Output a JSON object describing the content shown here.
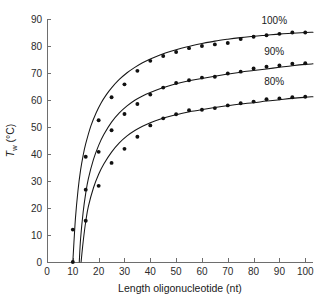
{
  "chart_data": {
    "type": "scatter",
    "title": "",
    "subtitle": "",
    "xlabel": "Length oligonucleotide (nt)",
    "ylabel": "T_w (°C)",
    "ylabel_parts": {
      "symbol": "T",
      "subscript": "w",
      "unit": "(°C)"
    },
    "xlim": [
      0,
      103
    ],
    "ylim": [
      0,
      90
    ],
    "xticks": [
      0,
      10,
      20,
      30,
      40,
      50,
      60,
      70,
      80,
      90,
      100
    ],
    "yticks": [
      0,
      10,
      20,
      30,
      40,
      50,
      60,
      70,
      80,
      90
    ],
    "xtick_labels": [
      "0",
      "10",
      "20",
      "30",
      "40",
      "50",
      "60",
      "70",
      "80",
      "90",
      "100"
    ],
    "ytick_labels": [
      "0",
      "10",
      "20",
      "30",
      "40",
      "50",
      "60",
      "70",
      "80",
      "90"
    ],
    "grid": false,
    "legend_position": "inline-right-of-curves",
    "marker": "filled-circle",
    "marker_color": "#111111",
    "line_color": "#161616",
    "axis_color": "#6e6e6e",
    "series": [
      {
        "name": "100%",
        "label": "100%",
        "label_x": 88,
        "label_y": 88,
        "x": [
          10,
          15,
          20,
          25,
          30,
          35,
          40,
          45,
          50,
          55,
          60,
          65,
          70,
          75,
          80,
          85,
          90,
          95,
          100
        ],
        "values": [
          12.0,
          39.0,
          52.5,
          61.0,
          65.8,
          70.8,
          74.5,
          76.3,
          77.8,
          79.2,
          80.0,
          80.6,
          81.1,
          82.6,
          83.4,
          84.0,
          84.5,
          85.0,
          85.0
        ],
        "curve_x": [
          10.0,
          11,
          12,
          13,
          14,
          15,
          17,
          19,
          21,
          23,
          25,
          28,
          31,
          34,
          37,
          40,
          44,
          48,
          52,
          56,
          60,
          65,
          70,
          75,
          80,
          85,
          90,
          95,
          100,
          103
        ],
        "curve_y": [
          0.0,
          16.0,
          26.5,
          34.0,
          39.5,
          43.8,
          50.4,
          55.2,
          59.0,
          62.0,
          64.5,
          67.6,
          70.1,
          72.1,
          73.8,
          75.2,
          76.8,
          78.1,
          79.2,
          80.1,
          80.9,
          81.8,
          82.5,
          83.1,
          83.6,
          84.0,
          84.4,
          84.7,
          85.0,
          85.1
        ]
      },
      {
        "name": "90%",
        "label": "90%",
        "label_x": 88,
        "label_y": 76.5,
        "x": [
          10,
          15,
          20,
          25,
          30,
          35,
          40,
          45,
          50,
          55,
          60,
          65,
          70,
          75,
          80,
          85,
          90,
          95,
          100
        ],
        "values": [
          0.0,
          26.8,
          40.8,
          48.8,
          54.8,
          58.5,
          62.0,
          64.6,
          66.3,
          67.3,
          68.3,
          68.6,
          69.8,
          70.5,
          71.7,
          72.3,
          72.8,
          73.4,
          73.6
        ],
        "curve_x": [
          12.5,
          13,
          14,
          15,
          16,
          18,
          20,
          22,
          25,
          28,
          31,
          34,
          37,
          40,
          44,
          48,
          52,
          56,
          60,
          65,
          70,
          75,
          80,
          85,
          90,
          95,
          100,
          103
        ],
        "curve_y": [
          0.0,
          8.5,
          18.5,
          25.5,
          30.8,
          38.0,
          43.2,
          47.2,
          51.8,
          55.2,
          57.8,
          59.9,
          61.5,
          62.8,
          64.3,
          65.5,
          66.5,
          67.3,
          68.0,
          68.8,
          69.6,
          70.3,
          70.9,
          71.5,
          72.1,
          72.7,
          73.2,
          73.4
        ]
      },
      {
        "name": "80%",
        "label": "80%",
        "label_x": 88,
        "label_y": 65.5,
        "x": [
          15,
          20,
          25,
          30,
          35,
          40,
          45,
          50,
          55,
          60,
          65,
          70,
          75,
          80,
          85,
          90,
          95,
          100
        ],
        "values": [
          15.3,
          28.2,
          36.7,
          41.9,
          46.4,
          50.6,
          53.2,
          54.7,
          56.2,
          56.4,
          57.0,
          58.0,
          58.8,
          59.4,
          60.3,
          60.6,
          61.0,
          61.2
        ],
        "curve_x": [
          13.2,
          14,
          15,
          16,
          18,
          20,
          22,
          25,
          28,
          31,
          34,
          37,
          40,
          44,
          48,
          52,
          56,
          60,
          65,
          70,
          75,
          80,
          85,
          90,
          95,
          100,
          103
        ],
        "curve_y": [
          0.0,
          7.5,
          15.0,
          20.5,
          27.5,
          32.5,
          36.3,
          40.7,
          44.1,
          46.7,
          48.7,
          50.3,
          51.6,
          53.0,
          54.1,
          55.0,
          55.8,
          56.4,
          57.2,
          57.9,
          58.5,
          59.0,
          59.6,
          60.1,
          60.6,
          61.0,
          61.2
        ]
      }
    ]
  }
}
